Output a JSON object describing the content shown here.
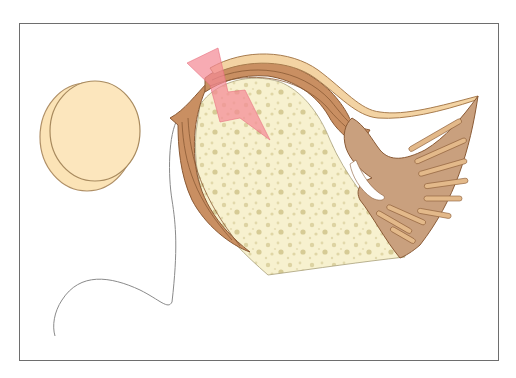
{
  "figure": {
    "frame": {
      "x": 19,
      "y": 23,
      "width": 480,
      "height": 338,
      "border_color": "#6e6e6e"
    },
    "elements": [
      {
        "name": "patella-disc",
        "shape": "oval",
        "fill": "#fbe3b6",
        "stroke": "#a88a5e"
      },
      {
        "name": "thread-line",
        "shape": "curve",
        "stroke": "#8a8a8a"
      },
      {
        "name": "cancellous-bone",
        "shape": "block",
        "fill": "#f7f1cf",
        "pore_color": "#d9cf9c"
      },
      {
        "name": "cortical-tendon-band",
        "shape": "curved-band",
        "fill": "#c98f62",
        "stroke": "#8a5a35"
      },
      {
        "name": "outer-tendon-sheath",
        "shape": "curved-band",
        "fill": "#f3d3a3",
        "stroke": "#a87c4e"
      },
      {
        "name": "muscle-fan",
        "shape": "fan",
        "fill": "#c9a07e",
        "stroke": "#8a5a35",
        "fiber_color": "#e3b98a"
      },
      {
        "name": "pain-bolt",
        "shape": "lightning-bolt",
        "fill": "#f48a96",
        "opacity": 0.75
      }
    ],
    "colors": {
      "background": "#ffffff",
      "bone": "#f7f1cf",
      "tendon": "#c98f62",
      "muscle": "#c9a07e",
      "disc": "#fbe3b6",
      "bolt": "#f48a96"
    }
  }
}
